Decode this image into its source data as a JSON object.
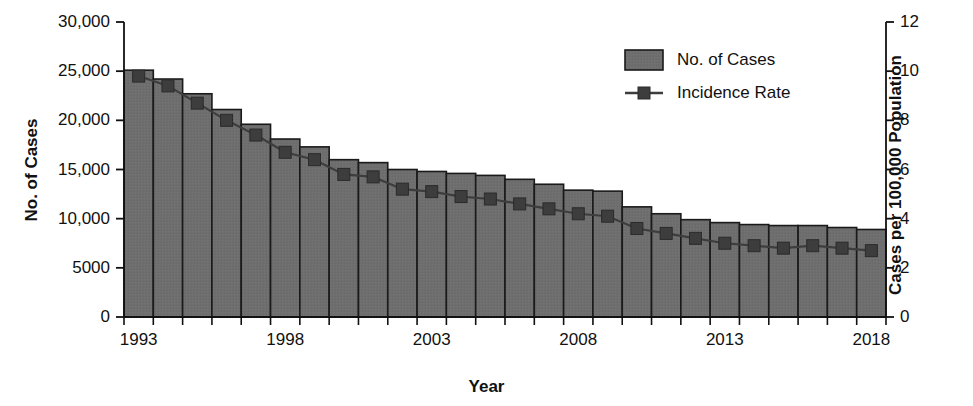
{
  "chart_data": {
    "type": "bar",
    "title": "",
    "xlabel": "Year",
    "ylabel": "No. of Cases",
    "y2label": "Cases per 100,000 Population",
    "grid": false,
    "legend_position": "top-right",
    "ylim": [
      0,
      30000
    ],
    "y2lim": [
      0,
      12
    ],
    "xlim": [
      1993,
      2018
    ],
    "yticks": [
      "0",
      "5000",
      "10,000",
      "15,000",
      "20,000",
      "25,000",
      "30,000"
    ],
    "ytick_values": [
      0,
      5000,
      10000,
      15000,
      20000,
      25000,
      30000
    ],
    "y2ticks": [
      "0",
      "2",
      "4",
      "6",
      "8",
      "10",
      "12"
    ],
    "y2tick_values": [
      0,
      2,
      4,
      6,
      8,
      10,
      12
    ],
    "xticks_labeled": [
      "1993",
      "1998",
      "2003",
      "2008",
      "2013",
      "2018"
    ],
    "categories": [
      1993,
      1994,
      1995,
      1996,
      1997,
      1998,
      1999,
      2000,
      2001,
      2002,
      2003,
      2004,
      2005,
      2006,
      2007,
      2008,
      2009,
      2010,
      2011,
      2012,
      2013,
      2014,
      2015,
      2016,
      2017,
      2018
    ],
    "series": [
      {
        "name": "No. of Cases",
        "type": "bar",
        "axis": "left",
        "color": "#6e6e6e",
        "edge_color": "#1a1a1a",
        "values": [
          25100,
          24200,
          22700,
          21100,
          19600,
          18100,
          17300,
          16000,
          15700,
          15000,
          14800,
          14600,
          14400,
          14000,
          13500,
          12900,
          12800,
          11200,
          10500,
          9900,
          9600,
          9400,
          9300,
          9300,
          9100,
          8900
        ]
      },
      {
        "name": "Incidence Rate",
        "type": "line",
        "axis": "right",
        "color": "#3d3d3d",
        "marker": "square",
        "values": [
          9.8,
          9.4,
          8.7,
          8.0,
          7.4,
          6.7,
          6.4,
          5.8,
          5.7,
          5.2,
          5.1,
          4.9,
          4.8,
          4.6,
          4.4,
          4.2,
          4.1,
          3.6,
          3.4,
          3.2,
          3.0,
          2.9,
          2.8,
          2.9,
          2.8,
          2.7
        ]
      }
    ],
    "legend": [
      {
        "label": "No. of Cases",
        "swatch": "bar",
        "color": "#6e6e6e"
      },
      {
        "label": "Incidence Rate",
        "swatch": "line-marker",
        "color": "#3d3d3d"
      }
    ]
  }
}
